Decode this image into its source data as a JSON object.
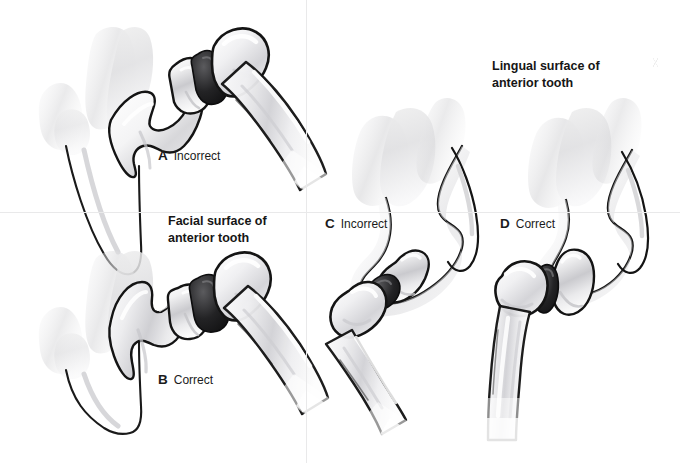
{
  "figure": {
    "width": 680,
    "height": 463,
    "background": "#ffffff",
    "outline_color": "#121212",
    "tissue_color": "#e3e3e5",
    "enamel_highlight": "#f6f6f7",
    "divider_color": "#e9e9ea"
  },
  "dividers": {
    "vertical_x": 306,
    "horizontal_y": 212
  },
  "captions": [
    {
      "id": "facial-surface",
      "text": "Facial surface of\nanterior tooth",
      "x": 168,
      "y": 213
    },
    {
      "id": "lingual-surface",
      "text": "Lingual surface of\nanterior tooth",
      "x": 492,
      "y": 58
    }
  ],
  "panels": [
    {
      "id": "a",
      "letter": "A",
      "verdict": "Incorrect",
      "label_x": 158,
      "label_y": 149,
      "surface": "facial",
      "quadrant": "top-left"
    },
    {
      "id": "b",
      "letter": "B",
      "verdict": "Correct",
      "label_x": 158,
      "label_y": 373,
      "surface": "facial",
      "quadrant": "bottom-left"
    },
    {
      "id": "c",
      "letter": "C",
      "verdict": "Incorrect",
      "label_x": 325,
      "label_y": 217,
      "surface": "lingual",
      "quadrant": "right-upper"
    },
    {
      "id": "d",
      "letter": "D",
      "verdict": "Correct",
      "label_x": 500,
      "label_y": 217,
      "surface": "lingual",
      "quadrant": "right-lower"
    }
  ],
  "speck": {
    "x": 652,
    "y": 58
  }
}
